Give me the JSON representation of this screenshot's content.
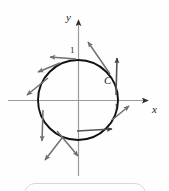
{
  "figure": {
    "type": "vector-field-on-circle-diagram",
    "axes": {
      "x_label": "x",
      "y_label": "y",
      "origin_px": [
        78,
        100
      ],
      "x_axis_span_px": [
        8,
        150
      ],
      "y_axis_span_px": [
        18,
        176
      ]
    },
    "tick_labels": {
      "y_one": "1",
      "x_one": "1"
    },
    "curve_label": "C",
    "curve": {
      "name": "C",
      "shape": "circle",
      "center": [
        0,
        0
      ],
      "radius": 1,
      "center_px": [
        78,
        100
      ],
      "radius_px": 40,
      "orientation": "clockwise"
    },
    "vectors": [
      {
        "name": "vector-top",
        "angle_deg": 90,
        "direction_deg": 180
      },
      {
        "name": "vector-upper-right",
        "angle_deg": 50,
        "direction_deg": 140
      },
      {
        "name": "vector-right-upper",
        "angle_deg": 20,
        "direction_deg": 90
      },
      {
        "name": "vector-right",
        "angle_deg": 0,
        "direction_deg": 90
      },
      {
        "name": "vector-lower-right",
        "angle_deg": -35,
        "direction_deg": 55
      },
      {
        "name": "vector-bottom",
        "angle_deg": -90,
        "direction_deg": 0
      },
      {
        "name": "vector-lower-left",
        "angle_deg": -125,
        "direction_deg": -55
      },
      {
        "name": "vector-left-lower",
        "angle_deg": -170,
        "direction_deg": -90
      },
      {
        "name": "vector-left-upper",
        "angle_deg": 150,
        "direction_deg": -140
      },
      {
        "name": "vector-upper-left",
        "angle_deg": 115,
        "direction_deg": 180
      }
    ],
    "colors": {
      "curve": "#111111",
      "axis": "#8e8e8e",
      "vector": "#767676",
      "vector_dark": "#3f3f3f",
      "caption_box": "#d8d8d8",
      "background": "#fefefe"
    }
  }
}
